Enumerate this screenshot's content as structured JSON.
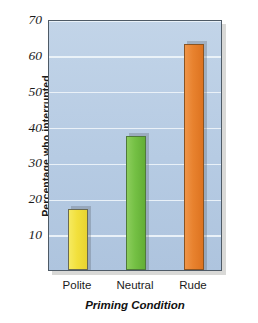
{
  "chart_data": {
    "type": "bar",
    "title": "",
    "xlabel": "Priming Condition",
    "ylabel": "Percentage who interrupted",
    "categories": [
      "Polite",
      "Neutral",
      "Rude"
    ],
    "values": [
      17,
      37.5,
      63
    ],
    "ylim": [
      0,
      70
    ],
    "yticks": [
      10,
      20,
      30,
      40,
      50,
      60,
      70
    ],
    "ytick_labels": [
      "10",
      "20",
      "30",
      "40",
      "50",
      "60",
      "70"
    ],
    "grid": true,
    "legend": "none",
    "bar_colors": [
      "#f2e03c",
      "#74c044",
      "#e8822e"
    ],
    "plot_background": "#b9cde4",
    "axis_border_color": "#4e5a66"
  }
}
